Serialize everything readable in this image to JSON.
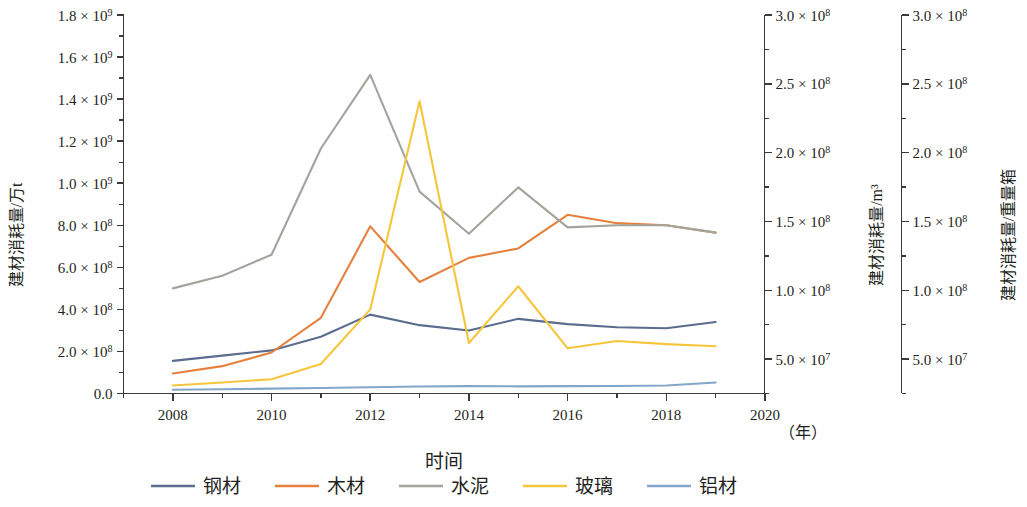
{
  "chart_data": {
    "type": "line",
    "title": "",
    "subtitle": "",
    "xlabel": "时间",
    "x_unit": "（年）",
    "x": [
      2008,
      2009,
      2010,
      2011,
      2012,
      2013,
      2014,
      2015,
      2016,
      2017,
      2018,
      2019
    ],
    "xlim": [
      2007,
      2020
    ],
    "x_ticks": [
      "2008",
      "2010",
      "2012",
      "2014",
      "2016",
      "2018",
      "2020"
    ],
    "x_tick_values": [
      2008,
      2010,
      2012,
      2014,
      2016,
      2018,
      2020
    ],
    "grid": false,
    "legend_position": "bottom",
    "axes": [
      {
        "id": "left",
        "ylabel": "建材消耗量/万t",
        "ylim": [
          0,
          1800000000
        ],
        "tick_values": [
          0,
          200000000,
          400000000,
          600000000,
          800000000,
          1000000000,
          1200000000,
          1400000000,
          1600000000,
          1800000000
        ],
        "tick_labels": [
          "0.0",
          "2.0 × 10⁸",
          "4.0 × 10⁸",
          "6.0 × 10⁸",
          "8.0 × 10⁸",
          "1.0 × 10⁹",
          "1.2 × 10⁹",
          "1.4 × 10⁹",
          "1.6 × 10⁹",
          "1.8 × 10⁹"
        ],
        "tick_mantissas": [
          "0.0",
          "2.0",
          "4.0",
          "6.0",
          "8.0",
          "1.0",
          "1.2",
          "1.4",
          "1.6",
          "1.8"
        ],
        "tick_exponents": [
          "",
          "8",
          "8",
          "8",
          "8",
          "9",
          "9",
          "9",
          "9",
          "9"
        ]
      },
      {
        "id": "middle",
        "ylabel": "建材消耗量/m³",
        "ylim": [
          25000000,
          300000000
        ],
        "tick_values": [
          50000000,
          100000000,
          150000000,
          200000000,
          250000000,
          300000000
        ],
        "tick_labels": [
          "5.0 × 10⁷",
          "1.0 × 10⁸",
          "1.5 × 10⁸",
          "2.0 × 10⁸",
          "2.5 × 10⁸",
          "3.0 × 10⁸"
        ],
        "tick_mantissas": [
          "5.0",
          "1.0",
          "1.5",
          "2.0",
          "2.5",
          "3.0"
        ],
        "tick_exponents": [
          "7",
          "8",
          "8",
          "8",
          "8",
          "8"
        ]
      },
      {
        "id": "right",
        "ylabel": "建材消耗量/重量箱",
        "ylim": [
          25000000,
          300000000
        ],
        "tick_values": [
          50000000,
          100000000,
          150000000,
          200000000,
          250000000,
          300000000
        ],
        "tick_labels": [
          "5.0 × 10⁷",
          "1.0 × 10⁸",
          "1.5 × 10⁸",
          "2.0 × 10⁸",
          "2.5 × 10⁸",
          "3.0 × 10⁸"
        ],
        "tick_mantissas": [
          "5.0",
          "1.0",
          "1.5",
          "2.0",
          "2.5",
          "3.0"
        ],
        "tick_exponents": [
          "7",
          "8",
          "8",
          "8",
          "8",
          "8"
        ]
      }
    ],
    "series": [
      {
        "name": "钢材",
        "key": "steel",
        "color": "#5b6c8f",
        "axis": "left",
        "values": [
          155000000,
          180000000,
          205000000,
          270000000,
          375000000,
          325000000,
          300000000,
          355000000,
          330000000,
          315000000,
          310000000,
          340000000
        ]
      },
      {
        "name": "木材",
        "key": "wood",
        "color": "#e5813d",
        "axis": "left",
        "values": [
          95000000,
          130000000,
          195000000,
          360000000,
          795000000,
          530000000,
          645000000,
          690000000,
          850000000,
          810000000,
          800000000,
          765000000
        ]
      },
      {
        "name": "水泥",
        "key": "cement",
        "color": "#a1a59b",
        "axis": "left",
        "values": [
          500000000,
          560000000,
          660000000,
          1165000000,
          1515000000,
          960000000,
          760000000,
          980000000,
          790000000,
          800000000,
          800000000,
          765000000
        ]
      },
      {
        "name": "玻璃",
        "key": "glass",
        "color": "#f5c63c",
        "axis": "left",
        "values": [
          38000000,
          52000000,
          68000000,
          140000000,
          400000000,
          1390000000,
          240000000,
          510000000,
          215000000,
          250000000,
          235000000,
          225000000
        ]
      },
      {
        "name": "铝材",
        "key": "aluminum",
        "color": "#83a6c9",
        "axis": "left",
        "values": [
          18000000,
          20000000,
          23000000,
          26000000,
          30000000,
          33000000,
          35000000,
          34000000,
          35000000,
          36000000,
          38000000,
          52000000
        ]
      }
    ],
    "legend": [
      {
        "label": "钢材",
        "color": "#5b6c8f"
      },
      {
        "label": "木材",
        "color": "#e5813d"
      },
      {
        "label": "水泥",
        "color": "#a1a59b"
      },
      {
        "label": "玻璃",
        "color": "#f5c63c"
      },
      {
        "label": "铝材",
        "color": "#83a6c9"
      }
    ]
  }
}
